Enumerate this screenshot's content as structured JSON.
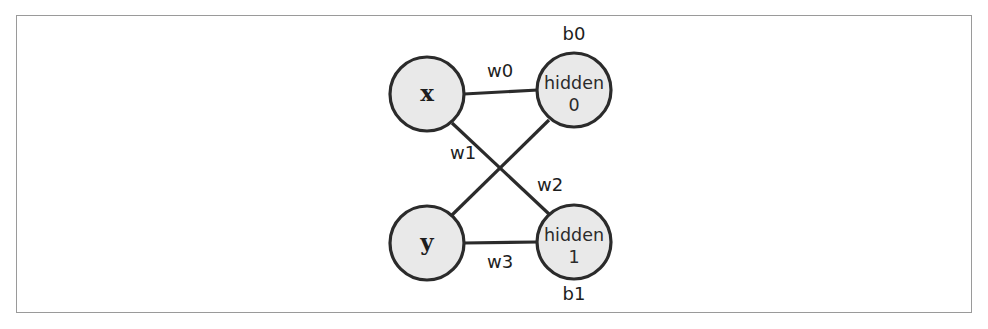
{
  "figure": {
    "type": "neural-network-diagram",
    "background_color": "#ffffff",
    "frame_color": "#9a9a9a",
    "node_fill_color": "#e9e9e9",
    "node_stroke_color": "#2b2b2b",
    "edge_color": "#2b2b2b"
  },
  "nodes": {
    "input_x": {
      "label": "x",
      "cx": 427,
      "cy": 94,
      "r": 37
    },
    "input_y": {
      "label": "y",
      "cx": 427,
      "cy": 243,
      "r": 37
    },
    "hidden_0": {
      "label_line1": "hidden",
      "label_line2": "0",
      "cx": 574,
      "cy": 90,
      "r": 37
    },
    "hidden_1": {
      "label_line1": "hidden",
      "label_line2": "1",
      "cx": 574,
      "cy": 242,
      "r": 37
    }
  },
  "biases": [
    {
      "name": "bias-b0",
      "label": "b0",
      "x": 574,
      "y": 35
    },
    {
      "name": "bias-b1",
      "label": "b1",
      "x": 574,
      "y": 295
    }
  ],
  "edges": [
    {
      "name": "edge-x-hidden0",
      "label": "w0",
      "from": "input_x",
      "to": "hidden_0",
      "label_x": 500,
      "label_y": 72
    },
    {
      "name": "edge-x-hidden1",
      "label": "w1",
      "from": "input_x",
      "to": "hidden_1",
      "label_x": 463,
      "label_y": 154
    },
    {
      "name": "edge-y-hidden0",
      "label": "w2",
      "from": "input_y",
      "to": "hidden_0",
      "label_x": 550,
      "label_y": 186
    },
    {
      "name": "edge-y-hidden1",
      "label": "w3",
      "from": "input_y",
      "to": "hidden_1",
      "label_x": 500,
      "label_y": 263
    }
  ]
}
